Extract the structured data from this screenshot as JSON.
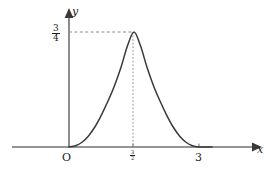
{
  "figure": {
    "background_color": "#ffffff",
    "ink_color": "#1a1a1a",
    "curve_color": "#3a3a3a",
    "axis_color": "#707070",
    "guide_color": "#8a8a8a"
  },
  "axes": {
    "x_name": "x",
    "y_name": "y",
    "origin_label": "O"
  },
  "ticks": {
    "x": [
      {
        "label_numerator": "3",
        "label_denominator": "2",
        "value": 1.5,
        "is_fraction": true
      },
      {
        "label": "3",
        "value": 3,
        "is_fraction": false
      }
    ],
    "y": [
      {
        "label_numerator": "3",
        "label_denominator": "4",
        "value": 0.75,
        "is_fraction": true
      }
    ]
  },
  "chart_data": {
    "type": "line",
    "title": "",
    "subtitle": "",
    "xlabel": "x",
    "ylabel": "y",
    "xlim": [
      -0.65,
      4.2
    ],
    "ylim": [
      -0.09,
      0.98
    ],
    "grid": false,
    "legend": null,
    "legend_position": "none",
    "annotations": [
      {
        "type": "dashed-horizontal",
        "from_x": 0,
        "to_x": 1.5,
        "y": 0.75,
        "label": "3/4"
      },
      {
        "type": "dotted-vertical",
        "x": 1.5,
        "from_y": 0,
        "to_y": 0.75,
        "label": "3/2"
      },
      {
        "type": "point",
        "x": 1.5,
        "y": 0.75,
        "label": "maximum"
      }
    ],
    "series": [
      {
        "name": "curve",
        "x": [
          0,
          0.15,
          0.3,
          0.45,
          0.6,
          0.75,
          0.9,
          1.05,
          1.2,
          1.35,
          1.5,
          1.65,
          1.8,
          1.95,
          2.1,
          2.25,
          2.4,
          2.55,
          2.7,
          2.85,
          3,
          3.15,
          3.3
        ],
        "y": [
          0,
          0.008,
          0.031,
          0.072,
          0.132,
          0.21,
          0.3,
          0.4,
          0.52,
          0.66,
          0.75,
          0.66,
          0.52,
          0.4,
          0.3,
          0.21,
          0.132,
          0.072,
          0.031,
          0.008,
          0,
          0,
          0
        ]
      }
    ]
  }
}
